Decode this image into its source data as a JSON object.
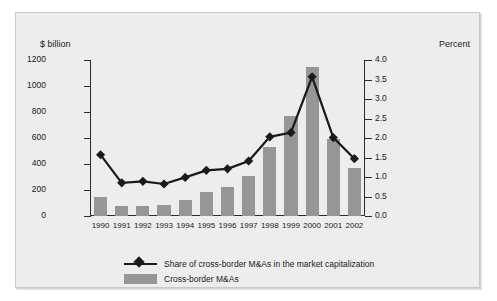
{
  "chart_data": {
    "type": "bar",
    "title": "",
    "categories": [
      "1990",
      "1991",
      "1992",
      "1993",
      "1994",
      "1995",
      "1996",
      "1997",
      "1998",
      "1999",
      "2000",
      "2001",
      "2002"
    ],
    "xlabel": "",
    "ylabel": "$ billion",
    "y2label": "Percent",
    "ylim": [
      0,
      1200
    ],
    "y2lim": [
      0.0,
      4.0
    ],
    "yticks": [
      "0",
      "200",
      "400",
      "600",
      "800",
      "1000",
      "1200"
    ],
    "y2ticks": [
      "0.0",
      "0.5",
      "1.0",
      "1.5",
      "2.0",
      "2.5",
      "3.0",
      "3.5",
      "4.0"
    ],
    "grid": false,
    "legend_position": "bottom-left",
    "series": [
      {
        "name": "Cross-border M&As",
        "type": "bar",
        "axis": "left",
        "unit": "$ billion",
        "color": "#969696",
        "values": [
          150,
          80,
          79,
          83,
          127,
          187,
          227,
          305,
          532,
          766,
          1144,
          594,
          370
        ]
      },
      {
        "name": "Share of cross-border M&As in the market capitalization",
        "type": "line",
        "axis": "right",
        "unit": "Percent",
        "color": "#1a1a1a",
        "marker": "diamond",
        "values": [
          1.57,
          0.85,
          0.89,
          0.82,
          0.99,
          1.17,
          1.21,
          1.41,
          2.03,
          2.14,
          3.57,
          2.01,
          1.47
        ]
      }
    ]
  },
  "legend": {
    "items": [
      {
        "label": "Share of cross-border M&As in the market capitalization",
        "key": "line-marker"
      },
      {
        "label": "Cross-border M&As",
        "key": "swatch"
      }
    ]
  }
}
